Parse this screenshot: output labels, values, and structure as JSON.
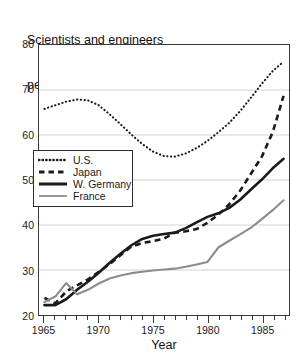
{
  "chart_data": {
    "type": "line",
    "title": "Scientists and engineers per 10,000 labor force",
    "title_lines": [
      "Scientists and engineers",
      "per 10,000 labor force"
    ],
    "xlabel": "Year",
    "ylabel": "",
    "xlim": [
      1964.5,
      1987.5
    ],
    "ylim": [
      20,
      80
    ],
    "yticks": [
      80,
      70,
      60,
      50,
      40,
      30,
      20
    ],
    "ytick_labels": [
      "80",
      "70",
      "60",
      "50",
      "40",
      "30",
      "20"
    ],
    "xticks_major": [
      1965,
      1970,
      1975,
      1980,
      1985
    ],
    "xtick_labels": [
      "1965",
      "1970",
      "1975",
      "1980",
      "1985"
    ],
    "xticks_minor_step": 1,
    "grid": "horizontal",
    "legend_position": "center-left",
    "x": [
      1965,
      1966,
      1967,
      1968,
      1969,
      1970,
      1971,
      1972,
      1973,
      1974,
      1975,
      1976,
      1977,
      1978,
      1979,
      1980,
      1981,
      1982,
      1983,
      1984,
      1985,
      1986,
      1987
    ],
    "series": [
      {
        "name": "U.S.",
        "style": "dotted",
        "color": "#1a1a1a",
        "values": [
          65.8,
          66.6,
          67.4,
          67.9,
          67.7,
          66.6,
          64.6,
          62.4,
          60.1,
          58.0,
          56.3,
          55.3,
          55.2,
          55.9,
          57.1,
          58.7,
          60.6,
          62.7,
          65.3,
          68.3,
          71.4,
          74.2,
          76.3
        ]
      },
      {
        "name": "Japan",
        "style": "dashed",
        "color": "#1a1a1a",
        "values": [
          23.8,
          22.6,
          25.2,
          26.6,
          27.9,
          29.6,
          31.3,
          33.3,
          35.2,
          36.0,
          36.4,
          37.0,
          38.3,
          38.6,
          39.1,
          40.5,
          42.3,
          44.6,
          47.6,
          51.4,
          55.2,
          60.6,
          68.7
        ]
      },
      {
        "name": "W. Germany",
        "style": "solid",
        "color": "#1a1a1a",
        "values": [
          22.2,
          22.2,
          23.5,
          25.6,
          27.4,
          29.4,
          31.6,
          33.6,
          35.5,
          36.9,
          37.6,
          38.0,
          38.3,
          39.3,
          40.6,
          41.8,
          42.6,
          43.8,
          45.6,
          47.9,
          50.1,
          52.6,
          54.7
        ]
      },
      {
        "name": "France",
        "style": "solid-gray",
        "color": "#8c8c8c",
        "values": [
          22.9,
          24.1,
          27.1,
          24.6,
          25.6,
          27.0,
          28.1,
          28.8,
          29.3,
          29.6,
          29.9,
          30.1,
          30.3,
          30.7,
          31.2,
          31.8,
          35.0,
          36.5,
          37.9,
          39.4,
          41.3,
          43.3,
          45.5
        ]
      }
    ]
  },
  "legend": {
    "items": [
      {
        "label": "U.S.",
        "swatch": "dotted-line-swatch"
      },
      {
        "label": "Japan",
        "swatch": "dashed-line-swatch"
      },
      {
        "label": "W. Germany",
        "swatch": "solid-line-swatch"
      },
      {
        "label": "France",
        "swatch": "gray-line-swatch"
      }
    ]
  }
}
